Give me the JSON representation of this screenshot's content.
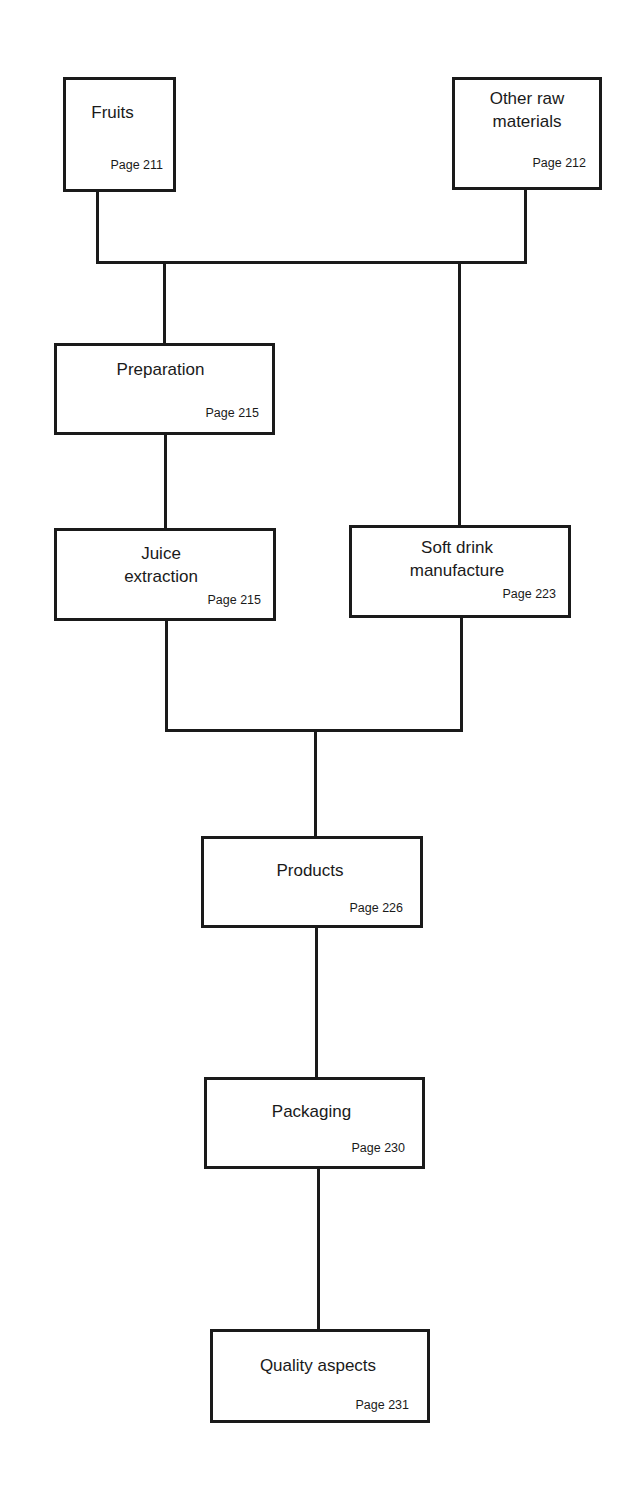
{
  "diagram": {
    "type": "flowchart",
    "nodes": {
      "fruits": {
        "title": "Fruits",
        "page": "Page 211"
      },
      "other_raw_materials": {
        "title": "Other raw\nmaterials",
        "page": "Page 212"
      },
      "preparation": {
        "title": "Preparation",
        "page": "Page 215"
      },
      "juice_extraction": {
        "title": "Juice\nextraction",
        "page": "Page 215"
      },
      "soft_drink_manufacture": {
        "title": "Soft drink\nmanufacture",
        "page": "Page 223"
      },
      "products": {
        "title": "Products",
        "page": "Page 226"
      },
      "packaging": {
        "title": "Packaging",
        "page": "Page 230"
      },
      "quality_aspects": {
        "title": "Quality aspects",
        "page": "Page 231"
      }
    },
    "edges": [
      [
        "fruits",
        "preparation"
      ],
      [
        "fruits",
        "soft_drink_manufacture"
      ],
      [
        "other_raw_materials",
        "preparation"
      ],
      [
        "other_raw_materials",
        "soft_drink_manufacture"
      ],
      [
        "preparation",
        "juice_extraction"
      ],
      [
        "juice_extraction",
        "products"
      ],
      [
        "soft_drink_manufacture",
        "products"
      ],
      [
        "products",
        "packaging"
      ],
      [
        "packaging",
        "quality_aspects"
      ]
    ],
    "colors": {
      "stroke": "#1a1a1a",
      "background": "#ffffff"
    }
  }
}
